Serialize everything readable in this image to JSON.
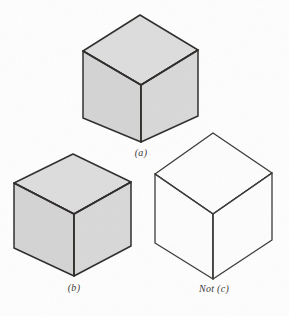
{
  "figure": {
    "width": 289,
    "height": 316,
    "background_color": "#fefefe",
    "line_color": "#2e2c2a",
    "shaded_fill_color": "#d6d6d6",
    "unshaded_fill_color": "#fdfdfd",
    "top_face_fill_color": "#dcdcdc",
    "label_color": "#3c3a38"
  },
  "cubes": [
    {
      "id": "cube-a",
      "label": "(a)",
      "shaded": true,
      "label_x": 141,
      "label_y": 148,
      "vertices": {
        "apex_top": [
          140,
          15
        ],
        "top_left": [
          83,
          51
        ],
        "top_right": [
          198,
          50
        ],
        "center": [
          141,
          85
        ],
        "bottom_left": [
          83,
          118
        ],
        "bottom_right": [
          198,
          116
        ],
        "bottom_center": [
          141,
          142
        ]
      }
    },
    {
      "id": "cube-b",
      "label": "(b)",
      "shaded": true,
      "label_x": 74,
      "label_y": 283,
      "vertices": {
        "apex_top": [
          73,
          154
        ],
        "top_left": [
          14,
          183
        ],
        "top_right": [
          131,
          182
        ],
        "center": [
          74,
          214
        ],
        "bottom_left": [
          14,
          248
        ],
        "bottom_right": [
          131,
          246
        ],
        "bottom_center": [
          74,
          276
        ]
      }
    },
    {
      "id": "cube-c",
      "label": "Not (c)",
      "shaded": false,
      "label_x": 214,
      "label_y": 284,
      "vertices": {
        "apex_top": [
          213,
          133
        ],
        "top_left": [
          155,
          174
        ],
        "top_right": [
          272,
          173
        ],
        "center": [
          213,
          214
        ],
        "bottom_left": [
          155,
          243
        ],
        "bottom_right": [
          272,
          240
        ],
        "bottom_center": [
          213,
          279
        ]
      }
    }
  ]
}
